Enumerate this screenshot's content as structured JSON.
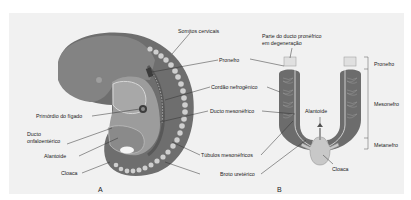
{
  "figure": {
    "panel_a": {
      "letter": "A",
      "labels": {
        "somitos": "Somitos cervicais",
        "pronefro": "Pronefro",
        "cordao": "Cordão nefrogênico",
        "ducto_meso": "Ducto mesonéfrico",
        "primordio": "Primórdio do fígado",
        "ducto_onfalo_1": "Ducto",
        "ducto_onfalo_2": "onfaloentérico",
        "alantoide": "Alantoide",
        "cloaca": "Cloaca",
        "tubulos": "Túbulos mesonéfricos",
        "broto": "Broto uretérico"
      }
    },
    "panel_b": {
      "letter": "B",
      "labels": {
        "parte_1": "Parte do ducto pronéfrico",
        "parte_2": "em degeneração",
        "alantoide": "Alantoide",
        "cloaca": "Cloaca",
        "pronefro": "Pronefro",
        "mesonefro": "Mesonefro",
        "metanefro": "Metanefro"
      }
    },
    "colors": {
      "embryo_dark": "#6e6e6e",
      "embryo_mid": "#8f8f8f",
      "embryo_light": "#b5b5b5",
      "somite": "#cfcfcf",
      "background": "#f1f1f1"
    }
  }
}
